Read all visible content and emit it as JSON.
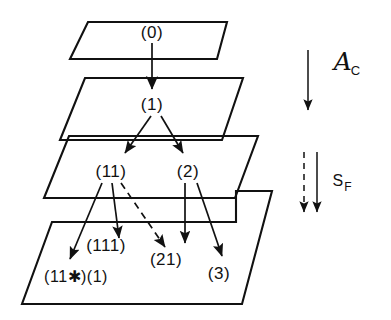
{
  "figure": {
    "background_color": "#ffffff",
    "stroke_color": "#111111",
    "width": 391,
    "height": 320
  },
  "planes": [
    {
      "name": "plane-level-0",
      "label": "(0)"
    },
    {
      "name": "plane-level-1",
      "label": "(1)"
    },
    {
      "name": "plane-level-2",
      "label": "(11) (2)"
    },
    {
      "name": "plane-level-3",
      "label": "(111) (21) (3) (11*)(1)"
    }
  ],
  "nodes": [
    {
      "id": "n0",
      "label": "(0)",
      "x": 152,
      "y": 33,
      "plane": 0
    },
    {
      "id": "n1",
      "label": "(1)",
      "x": 152,
      "y": 105,
      "plane": 1
    },
    {
      "id": "n11",
      "label": "(11)",
      "x": 111,
      "y": 172,
      "plane": 2
    },
    {
      "id": "n2",
      "label": "(2)",
      "x": 188,
      "y": 172,
      "plane": 2
    },
    {
      "id": "n111",
      "label": "(111)",
      "x": 106,
      "y": 246,
      "plane": 3
    },
    {
      "id": "n21",
      "label": "(21)",
      "x": 166,
      "y": 260,
      "plane": 3
    },
    {
      "id": "n3",
      "label": "(3)",
      "x": 219,
      "y": 274,
      "plane": 3
    },
    {
      "id": "n11s",
      "label": "(11✱)(1)",
      "x": 76,
      "y": 277,
      "plane": 3
    }
  ],
  "arrows": [
    {
      "name": "arrow-0-to-1",
      "from": "(0)",
      "to": "(1)",
      "style": "solid"
    },
    {
      "name": "arrow-1-to-11",
      "from": "(1)",
      "to": "(11)",
      "style": "solid"
    },
    {
      "name": "arrow-1-to-2",
      "from": "(1)",
      "to": "(2)",
      "style": "solid"
    },
    {
      "name": "arrow-11-to-11star",
      "from": "(11)",
      "to": "(11✱)(1)",
      "style": "solid"
    },
    {
      "name": "arrow-11-to-111",
      "from": "(11)",
      "to": "(111)",
      "style": "solid"
    },
    {
      "name": "arrow-11-to-21",
      "from": "(11)",
      "to": "(21)",
      "style": "dashed"
    },
    {
      "name": "arrow-2-to-21",
      "from": "(2)",
      "to": "(21)",
      "style": "solid"
    },
    {
      "name": "arrow-2-to-3",
      "from": "(2)",
      "to": "(3)",
      "style": "solid"
    }
  ],
  "legend": {
    "top": {
      "name": "operator-a-c",
      "symbol": "ᴀ",
      "base": "A",
      "subscript": "C",
      "arrow_style": "solid",
      "arrow_count": 1
    },
    "bottom": {
      "name": "operator-s-f",
      "base": "S",
      "subscript": "F",
      "arrow_styles": [
        "dashed",
        "solid"
      ],
      "arrow_count": 2
    }
  }
}
